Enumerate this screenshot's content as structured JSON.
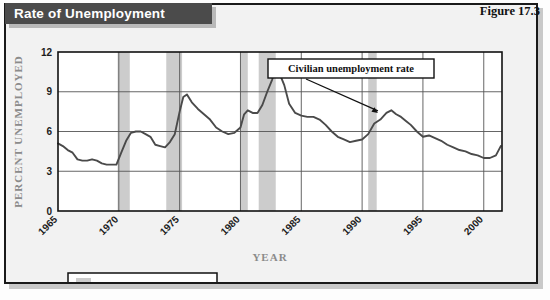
{
  "figure": {
    "banner_title": "Rate of Unemployment",
    "figure_number": "Figure 17.3"
  },
  "colors": {
    "banner_bg": "#4b4b4b",
    "banner_text": "#ffffff",
    "plot_bg": "#ffffff",
    "panel_bg": "#f2f2f2",
    "line": "#4a4a4a",
    "recession_band": "#cccccc",
    "grid": "#555555",
    "axis_title": "#8b8b8b",
    "frame": "#1a1a1a"
  },
  "chart_data": {
    "type": "line",
    "title": "Rate of Unemployment",
    "xlabel": "YEAR",
    "ylabel": "PERCENT UNEMPLOYED",
    "xlim": [
      1965,
      2001.5
    ],
    "ylim": [
      0,
      12
    ],
    "yticks": [
      0,
      3,
      6,
      9,
      12
    ],
    "xticks": [
      1965,
      1970,
      1975,
      1980,
      1985,
      1990,
      1995,
      2000
    ],
    "xtick_labels": [
      "1965",
      "1970",
      "1975",
      "1980",
      "1985",
      "1990",
      "1995",
      "2000"
    ],
    "ytick_labels": [
      "0",
      "3",
      "6",
      "9",
      "12"
    ],
    "grid": true,
    "grid_axis": "both",
    "legend_position": "below-left",
    "legend": [
      {
        "label": "Recession years",
        "swatch": "#cccccc"
      }
    ],
    "annotations": [
      {
        "text": "Civilian unemployment rate",
        "box": true,
        "points_to_x": 1991.3,
        "points_to_y": 7.4
      }
    ],
    "series": [
      {
        "name": "Civilian unemployment rate",
        "color": "#4a4a4a",
        "x": [
          1965.0,
          1965.4,
          1965.8,
          1966.2,
          1966.6,
          1967.0,
          1967.4,
          1967.8,
          1968.2,
          1968.6,
          1969.0,
          1969.4,
          1969.8,
          1970.2,
          1970.6,
          1971.0,
          1971.4,
          1971.8,
          1972.2,
          1972.6,
          1973.0,
          1973.4,
          1973.8,
          1974.2,
          1974.6,
          1975.0,
          1975.3,
          1975.6,
          1976.0,
          1976.5,
          1977.0,
          1977.5,
          1978.0,
          1978.5,
          1979.0,
          1979.5,
          1980.0,
          1980.3,
          1980.6,
          1981.0,
          1981.4,
          1981.8,
          1982.2,
          1982.6,
          1982.9,
          1983.2,
          1983.6,
          1984.0,
          1984.5,
          1985.0,
          1985.5,
          1986.0,
          1986.5,
          1987.0,
          1987.5,
          1988.0,
          1988.5,
          1989.0,
          1989.5,
          1990.0,
          1990.5,
          1991.0,
          1991.5,
          1992.0,
          1992.4,
          1992.8,
          1993.2,
          1993.6,
          1994.0,
          1994.5,
          1995.0,
          1995.5,
          1996.0,
          1996.5,
          1997.0,
          1997.5,
          1998.0,
          1998.5,
          1999.0,
          1999.5,
          2000.0,
          2000.5,
          2001.0,
          2001.4
        ],
        "y": [
          5.1,
          4.9,
          4.6,
          4.4,
          3.9,
          3.8,
          3.8,
          3.9,
          3.8,
          3.6,
          3.5,
          3.5,
          3.5,
          4.4,
          5.3,
          5.9,
          6.0,
          6.0,
          5.8,
          5.6,
          5.0,
          4.9,
          4.8,
          5.2,
          5.8,
          7.5,
          8.6,
          8.8,
          8.2,
          7.7,
          7.3,
          6.9,
          6.3,
          6.0,
          5.8,
          5.9,
          6.3,
          7.3,
          7.6,
          7.4,
          7.4,
          8.0,
          9.0,
          9.9,
          10.8,
          10.4,
          9.5,
          8.1,
          7.4,
          7.2,
          7.1,
          7.1,
          6.9,
          6.5,
          6.0,
          5.6,
          5.4,
          5.2,
          5.3,
          5.4,
          5.8,
          6.6,
          6.9,
          7.4,
          7.6,
          7.3,
          7.1,
          6.8,
          6.5,
          6.0,
          5.6,
          5.7,
          5.5,
          5.3,
          5.0,
          4.8,
          4.6,
          4.5,
          4.3,
          4.2,
          4.0,
          4.0,
          4.2,
          4.9
        ]
      }
    ],
    "recession_bands": [
      {
        "start": 1969.9,
        "end": 1970.9
      },
      {
        "start": 1973.9,
        "end": 1975.2
      },
      {
        "start": 1980.0,
        "end": 1980.6
      },
      {
        "start": 1981.5,
        "end": 1982.9
      },
      {
        "start": 1990.5,
        "end": 1991.2
      }
    ]
  }
}
